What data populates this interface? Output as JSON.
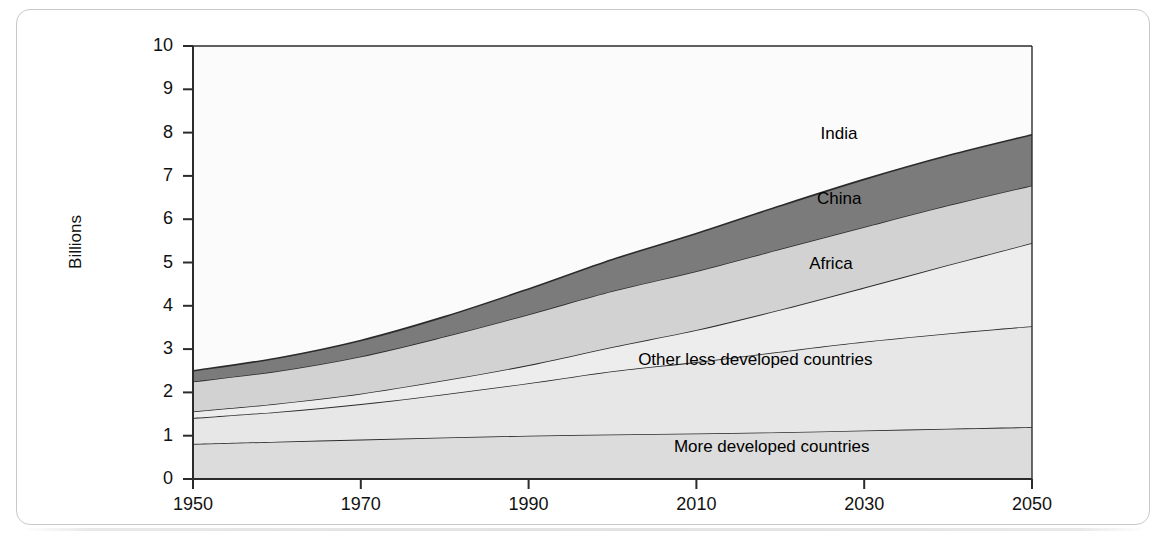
{
  "figure": {
    "y_axis_title": "Billions"
  },
  "chart_data": {
    "type": "area",
    "stacked": true,
    "title": "",
    "xlabel": "",
    "ylabel": "Billions",
    "xlim": [
      1950,
      2050
    ],
    "ylim": [
      0,
      10
    ],
    "xticks": [
      "1950",
      "1970",
      "1990",
      "2010",
      "2030",
      "2050"
    ],
    "yticks": [
      "0",
      "1",
      "2",
      "3",
      "4",
      "5",
      "6",
      "7",
      "8",
      "9",
      "10"
    ],
    "grid": false,
    "legend": "inline-labels",
    "x": [
      1950,
      1960,
      1970,
      1980,
      1990,
      2000,
      2010,
      2020,
      2030,
      2040,
      2050
    ],
    "series": [
      {
        "name": "More developed countries",
        "color": "#dcdcdc",
        "values": [
          0.81,
          0.86,
          0.91,
          0.96,
          1.0,
          1.03,
          1.05,
          1.08,
          1.12,
          1.16,
          1.2
        ]
      },
      {
        "name": "Other less developed countries",
        "color": "#e7e7e7",
        "values": [
          0.6,
          0.69,
          0.82,
          1.0,
          1.21,
          1.46,
          1.65,
          1.86,
          2.05,
          2.2,
          2.33
        ]
      },
      {
        "name": "Africa",
        "color": "#ededed",
        "values": [
          0.15,
          0.19,
          0.24,
          0.32,
          0.42,
          0.56,
          0.74,
          0.97,
          1.25,
          1.58,
          1.92
        ]
      },
      {
        "name": "China",
        "color": "#d2d2d2",
        "values": [
          0.69,
          0.75,
          0.86,
          1.01,
          1.17,
          1.29,
          1.36,
          1.4,
          1.4,
          1.38,
          1.33
        ]
      },
      {
        "name": "India",
        "color": "#7b7b7b",
        "values": [
          0.25,
          0.3,
          0.37,
          0.46,
          0.59,
          0.73,
          0.87,
          1.0,
          1.1,
          1.15,
          1.17
        ]
      }
    ],
    "series_totals_top": {
      "1950": [
        0.81,
        1.41,
        1.56,
        2.25,
        2.5
      ],
      "2010": [
        1.05,
        2.7,
        3.44,
        4.8,
        5.67
      ],
      "2050": [
        1.2,
        3.53,
        5.45,
        6.78,
        8.95
      ]
    },
    "label_positions": [
      {
        "name": "India",
        "x_year": 2027,
        "y_value": 7.95
      },
      {
        "name": "China",
        "x_year": 2027,
        "y_value": 6.45
      },
      {
        "name": "Africa",
        "x_year": 2026,
        "y_value": 4.95
      },
      {
        "name": "Other less developed countries",
        "x_year": 2017,
        "y_value": 2.72
      },
      {
        "name": "More developed countries",
        "x_year": 2019,
        "y_value": 0.72
      }
    ]
  }
}
